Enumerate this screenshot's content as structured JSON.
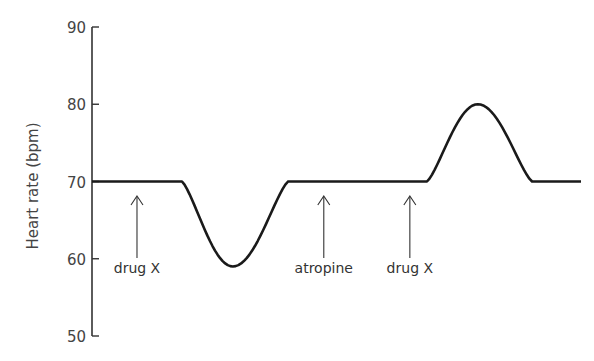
{
  "chart_data": {
    "type": "line",
    "title": "",
    "xlabel": "",
    "ylabel": "Heart rate (bpm)",
    "ylim": [
      50,
      90
    ],
    "yticks": [
      50,
      60,
      70,
      80,
      90
    ],
    "ytick_labels": [
      "50",
      "60",
      "70",
      "80",
      "90"
    ],
    "xlim": [
      0,
      100
    ],
    "x_axis_shown": false,
    "grid": false,
    "legend": "none",
    "series": [
      {
        "name": "Heart rate",
        "color": "#1a1a1a",
        "segments": [
          {
            "shape": "flat",
            "x_start": 0,
            "x_end": 18.4,
            "value": 70
          },
          {
            "shape": "dip",
            "x_start": 18.4,
            "x_peak": 28.8,
            "x_end": 40.1,
            "from": 70,
            "extreme": 59,
            "to": 70
          },
          {
            "shape": "flat",
            "x_start": 40.1,
            "x_end": 68.5,
            "value": 70
          },
          {
            "shape": "peak",
            "x_start": 68.5,
            "x_peak": 78.9,
            "x_end": 90.0,
            "from": 70,
            "extreme": 80,
            "to": 70
          },
          {
            "shape": "flat",
            "x_start": 90.0,
            "x_end": 100,
            "value": 70
          }
        ]
      }
    ],
    "annotations": [
      {
        "label": "drug X",
        "x": 9.2,
        "type": "arrow-up"
      },
      {
        "label": "atropine",
        "x": 47.4,
        "type": "arrow-up"
      },
      {
        "label": "drug X",
        "x": 65.0,
        "type": "arrow-up"
      }
    ]
  }
}
